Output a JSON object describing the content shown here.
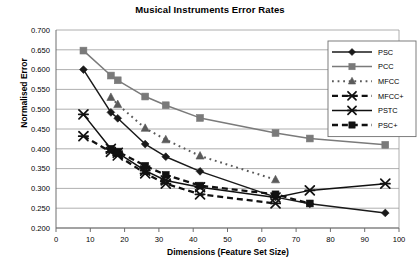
{
  "chart_data": {
    "type": "line",
    "title": "Musical Instruments Error Rates",
    "xlabel": "Dimensions (Feature Set Size)",
    "ylabel": "Normalised Error",
    "xlim": [
      0,
      100
    ],
    "ylim": [
      0.2,
      0.7
    ],
    "xticks": [
      0,
      10,
      20,
      30,
      40,
      50,
      60,
      70,
      80,
      90,
      100
    ],
    "xtick_labels": [
      "0",
      "10",
      "20",
      "30",
      "40",
      "50",
      "60",
      "70",
      "80",
      "90",
      "100"
    ],
    "yticks": [
      0.2,
      0.25,
      0.3,
      0.35,
      0.4,
      0.45,
      0.5,
      0.55,
      0.6,
      0.65,
      0.7
    ],
    "ytick_labels": [
      "0.200",
      "0.250",
      "0.300",
      "0.350",
      "0.400",
      "0.450",
      "0.500",
      "0.550",
      "0.600",
      "0.650",
      "0.700"
    ],
    "grid": "horizontal",
    "legend_position": "right-top",
    "series": [
      {
        "name": "PSC",
        "marker": "diamond",
        "line": "solid",
        "color": "#1a1a1a",
        "x": [
          8,
          16,
          18,
          26,
          32,
          42,
          64,
          74,
          96
        ],
        "y": [
          0.6,
          0.492,
          0.477,
          0.412,
          0.38,
          0.343,
          0.278,
          0.261,
          0.238
        ]
      },
      {
        "name": "PCC",
        "marker": "square",
        "line": "solid",
        "color": "#7a7a7a",
        "x": [
          8,
          16,
          18,
          26,
          32,
          42,
          64,
          74,
          96
        ],
        "y": [
          0.648,
          0.585,
          0.573,
          0.532,
          0.51,
          0.478,
          0.44,
          0.426,
          0.41
        ]
      },
      {
        "name": "MFCC",
        "marker": "triangle",
        "line": "dotted",
        "color": "#5a5a5a",
        "x": [
          16,
          18,
          26,
          32,
          42,
          64
        ],
        "y": [
          0.53,
          0.512,
          0.452,
          0.423,
          0.382,
          0.322
        ]
      },
      {
        "name": "MFCC+",
        "marker": "x-star",
        "line": "dashed",
        "color": "#111111",
        "x": [
          8,
          16,
          18,
          26,
          32,
          42,
          64
        ],
        "y": [
          0.432,
          0.392,
          0.383,
          0.338,
          0.312,
          0.285,
          0.262
        ]
      },
      {
        "name": "PSTC",
        "marker": "x-star",
        "line": "solid",
        "color": "#111111",
        "x": [
          8,
          16,
          18,
          26,
          32,
          42,
          64,
          74,
          96
        ],
        "y": [
          0.487,
          0.4,
          0.39,
          0.345,
          0.32,
          0.303,
          0.277,
          0.295,
          0.312
        ]
      },
      {
        "name": "PSC+",
        "marker": "square",
        "line": "dashed",
        "color": "#111111",
        "x": [
          16,
          18,
          26,
          32,
          42,
          64,
          74
        ],
        "y": [
          0.4,
          0.393,
          0.357,
          0.334,
          0.307,
          0.285,
          0.262
        ]
      }
    ]
  },
  "legend": {
    "items": [
      {
        "label": "PSC"
      },
      {
        "label": "PCC"
      },
      {
        "label": "MFCC"
      },
      {
        "label": "MFCC+"
      },
      {
        "label": "PSTC"
      },
      {
        "label": "PSC+"
      }
    ]
  }
}
